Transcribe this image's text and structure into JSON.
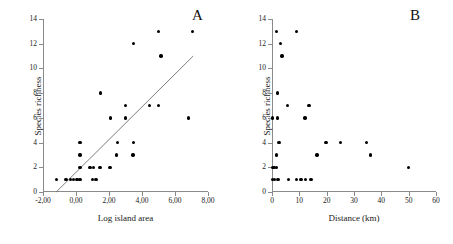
{
  "figure": {
    "background": "#ffffff",
    "point_color": "#000000",
    "axis_color": "#8a8a8a",
    "line_color": "#6e6e6e"
  },
  "panels": [
    {
      "letter": "A",
      "chart_data": {
        "type": "scatter",
        "title": "",
        "xlabel": "Log island area",
        "ylabel": "Species richness",
        "xlim": [
          -2.0,
          8.0
        ],
        "ylim": [
          0,
          14
        ],
        "xticks": [
          -2.0,
          0.0,
          2.0,
          4.0,
          6.0,
          8.0
        ],
        "xtick_labels": [
          "-2,00",
          "0,00",
          "2,00",
          "4,00",
          "6,00",
          "8,00"
        ],
        "yticks": [
          0,
          2,
          4,
          6,
          8,
          10,
          12,
          14
        ],
        "ytick_labels": [
          "0",
          "2",
          "4",
          "6",
          "8",
          "10",
          "12",
          "14"
        ],
        "grid": false,
        "legend": false,
        "points": [
          [
            -1.2,
            1
          ],
          [
            -0.6,
            1
          ],
          [
            -0.35,
            1
          ],
          [
            -0.15,
            1
          ],
          [
            0.05,
            1
          ],
          [
            0.25,
            1
          ],
          [
            1.0,
            1
          ],
          [
            1.2,
            1
          ],
          [
            0.25,
            2
          ],
          [
            0.85,
            2
          ],
          [
            1.05,
            2
          ],
          [
            1.45,
            2
          ],
          [
            2.05,
            2
          ],
          [
            0.25,
            3
          ],
          [
            2.45,
            3
          ],
          [
            3.45,
            3
          ],
          [
            0.25,
            4
          ],
          [
            2.5,
            4
          ],
          [
            3.5,
            4
          ],
          [
            2.1,
            6
          ],
          [
            3.0,
            6
          ],
          [
            6.8,
            6
          ],
          [
            3.0,
            7
          ],
          [
            4.45,
            7
          ],
          [
            5.0,
            7
          ],
          [
            1.5,
            8
          ],
          [
            5.15,
            11
          ],
          [
            3.5,
            12
          ],
          [
            5.0,
            13
          ],
          [
            7.05,
            13
          ]
        ],
        "fit_line": {
          "label": "regression line",
          "x_start": -1.2,
          "y_start": 0,
          "x_end": 7.1,
          "y_end": 11
        }
      }
    },
    {
      "letter": "B",
      "chart_data": {
        "type": "scatter",
        "title": "",
        "xlabel": "Distance (km)",
        "ylabel": "Species richness",
        "xlim": [
          0,
          60
        ],
        "ylim": [
          0,
          14
        ],
        "xticks": [
          0,
          10,
          20,
          30,
          40,
          50,
          60
        ],
        "xtick_labels": [
          "0",
          "10",
          "20",
          "30",
          "40",
          "50",
          "60"
        ],
        "yticks": [
          0,
          2,
          4,
          6,
          8,
          10,
          12,
          14
        ],
        "ytick_labels": [
          "0",
          "2",
          "4",
          "6",
          "8",
          "10",
          "12",
          "14"
        ],
        "grid": false,
        "legend": false,
        "points": [
          [
            0.2,
            1
          ],
          [
            1.0,
            1
          ],
          [
            2.2,
            1
          ],
          [
            6.0,
            1
          ],
          [
            9.0,
            1
          ],
          [
            10.6,
            1
          ],
          [
            12.2,
            1
          ],
          [
            14.2,
            1
          ],
          [
            0.2,
            2
          ],
          [
            0.8,
            2
          ],
          [
            1.6,
            2
          ],
          [
            50.0,
            2
          ],
          [
            1.6,
            3
          ],
          [
            16.4,
            3
          ],
          [
            36.0,
            3
          ],
          [
            2.6,
            4
          ],
          [
            19.8,
            4
          ],
          [
            25.0,
            4
          ],
          [
            34.6,
            4
          ],
          [
            0.2,
            6
          ],
          [
            2.0,
            6
          ],
          [
            12.0,
            6
          ],
          [
            5.6,
            7
          ],
          [
            13.6,
            7
          ],
          [
            2.0,
            8
          ],
          [
            3.6,
            11
          ],
          [
            3.0,
            12
          ],
          [
            1.6,
            13
          ],
          [
            9.0,
            13
          ]
        ]
      }
    }
  ]
}
